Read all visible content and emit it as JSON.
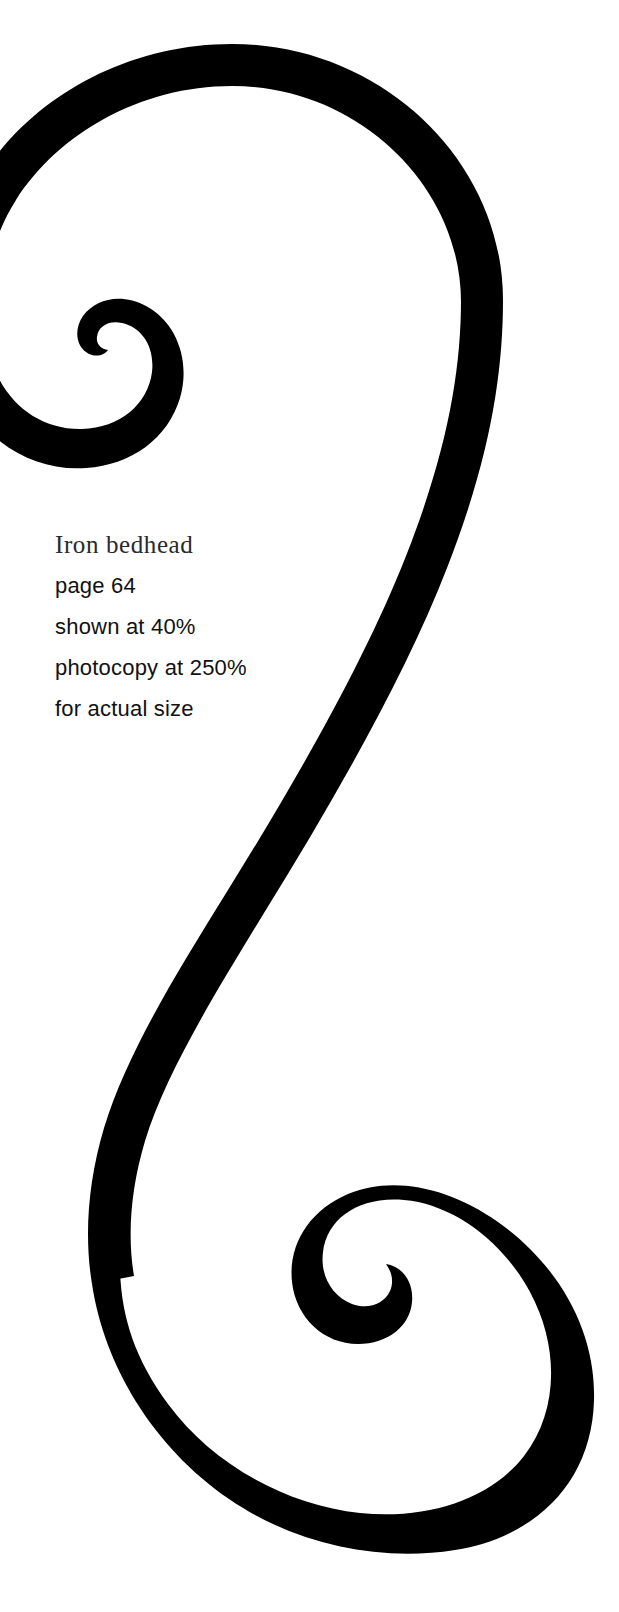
{
  "page": {
    "background_color": "#ffffff",
    "ink_color": "#000000",
    "width": 619,
    "height": 1612
  },
  "caption": {
    "title": "Iron bedhead",
    "lines": [
      "page 64",
      "shown at 40%",
      "photocopy at 250%",
      "for actual size"
    ],
    "page_number": "64",
    "shown_scale": "40%",
    "photocopy_scale": "250%"
  },
  "artwork": {
    "name": "iron-bedhead-s-scroll",
    "description": "S-shaped wrought iron scroll with volute spirals at both ends",
    "stroke_color": "#000000",
    "upper_spiral_eye": {
      "x": 125,
      "y": 345
    },
    "lower_spiral_eye": {
      "x": 455,
      "y": 1285
    }
  }
}
